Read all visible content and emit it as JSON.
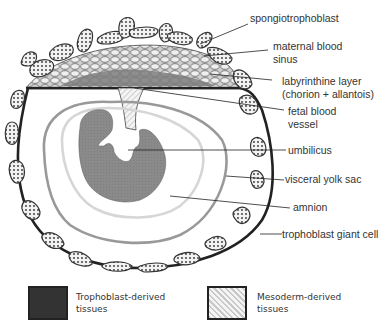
{
  "labels": {
    "spongiotrophoblast": "spongiotrophoblast",
    "maternal_blood_sinus": "maternal blood\nsinus",
    "labyrinthine_layer": "labyrinthine layer\n(chorion + allantois)",
    "fetal_blood_vessel": "fetal blood\nvessel",
    "umbilicus": "umbilicus",
    "visceral_yolk_sac": "visceral yolk sac",
    "amnion": "amnion",
    "trophoblast_giant_cell": "trophoblast giant cell"
  },
  "legend": [
    {
      "pattern": "dotted",
      "label": "Trophoblast-derived\ntissues"
    },
    {
      "pattern": "hatched",
      "label": "Mesoderm-derived\ntissues"
    }
  ],
  "colors": {
    "outline": "#222222",
    "embryo": "#8a8a8a",
    "visceral_yolk_sac_line": "#9a9a9a",
    "amnion_line": "#cfcfcf",
    "labyrinth": "#7d7d7d",
    "cell_fill": "#e6e6e6"
  }
}
